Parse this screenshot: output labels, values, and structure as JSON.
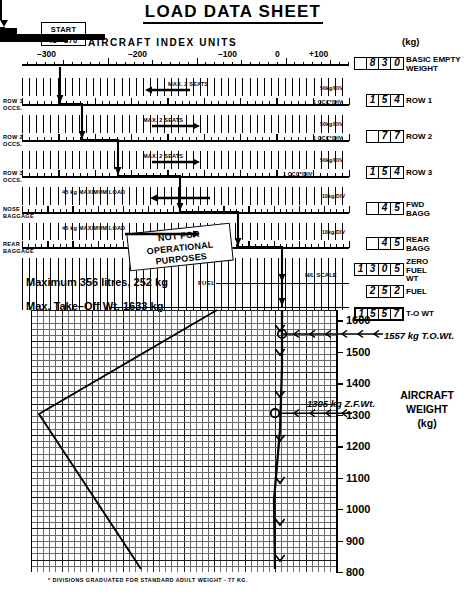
{
  "title": "LOAD DATA SHEET",
  "start": {
    "line1": "START",
    "line2": "IU –270"
  },
  "index_axis": {
    "heading": "AIRCRAFT  INDEX  UNITS",
    "ticks": [
      "–300",
      "–200",
      "–100",
      "0",
      "+100"
    ]
  },
  "units_header": "(kg)",
  "rows": [
    {
      "name": "basic-empty-weight",
      "left_label": "",
      "value": "830",
      "digits": [
        "",
        "8",
        "3",
        "0"
      ],
      "label": "BASIC EMPTY\nWEIGHT",
      "per_div": ""
    },
    {
      "name": "row-1",
      "left_label": "ROW 1\nOCCS.",
      "value": "154",
      "digits": [
        "1",
        "5",
        "4"
      ],
      "label": "ROW 1",
      "per_div": "50kg/DIV",
      "per_div2": "1 OCC*/DIV",
      "seat_note": "MAX. 2 SEATS"
    },
    {
      "name": "row-2",
      "left_label": "ROW 2\nOCCS.",
      "value": "77",
      "digits": [
        "",
        "7",
        "7"
      ],
      "label": "ROW 2",
      "per_div": "50kg/DIV",
      "per_div2": "1 OCC*/DIV",
      "seat_note": "MAX. 2 SEATS"
    },
    {
      "name": "row-3",
      "left_label": "ROW 3\nOCCS.",
      "value": "154",
      "digits": [
        "1",
        "5",
        "4"
      ],
      "label": "ROW 3",
      "per_div": "50kg/DIV",
      "per_div2": "1 OCC*/DIV",
      "seat_note": "MAX. 2 SEATS"
    },
    {
      "name": "fwd-bagg",
      "left_label": "NOSE\nBAGGAGE",
      "value": "45",
      "digits": [
        "",
        "4",
        "5"
      ],
      "label": "FWD\nBAGG",
      "per_div": "10kg/DIV",
      "max_note": "45 kg MAXIMUM LOAD"
    },
    {
      "name": "rear-bagg",
      "left_label": "REAR\nBAGGAGE",
      "value": "45",
      "digits": [
        "",
        "4",
        "5"
      ],
      "label": "REAR\nBAGG",
      "per_div": "10kg/DIV",
      "max_note": "45 kg MAXIMUM LOAD"
    },
    {
      "name": "zero-fuel-wt",
      "left_label": "",
      "value": "1305",
      "digits": [
        "1",
        "3",
        "0",
        "5"
      ],
      "label": "ZERO\nFUEL\nWT",
      "per_div": ""
    },
    {
      "name": "fuel",
      "left_label": "",
      "value": "252",
      "digits": [
        "2",
        "5",
        "2"
      ],
      "label": "FUEL",
      "per_div": "NIL  SCALE"
    },
    {
      "name": "to-wt",
      "left_label": "",
      "value": "1557",
      "digits": [
        "1",
        "5",
        "5",
        "7"
      ],
      "label": "T-O WT",
      "per_div": ""
    }
  ],
  "stamp": "NOT FOR\nOPERATIONAL\nPURPOSES",
  "fuel_note": "Maximum  356 litres, 252 kg",
  "fuel_tag": "FUEL",
  "max_tow_note": "Max. Take–Off Wt. 1633 kg",
  "annotations": {
    "tow": "1557 kg T.O.Wt.",
    "zfw": "1305 kg Z.F.Wt."
  },
  "weight_axis_label": "AIRCRAFT\nWEIGHT\n(kg)",
  "footnote": "* DIVISIONS GRADUATED FOR STANDARD ADULT WEIGHT - 77 KG.",
  "chart_data": {
    "type": "line",
    "title": "LOAD DATA SHEET",
    "xlabel": "AIRCRAFT INDEX UNITS",
    "ylabel": "AIRCRAFT WEIGHT (kg)",
    "ylim": [
      800,
      1633
    ],
    "yticks": [
      1600,
      1500,
      1400,
      1300,
      1200,
      1100,
      1000,
      900,
      800
    ],
    "xlim": [
      -330,
      130
    ],
    "xticks": [
      -300,
      -200,
      -100,
      0,
      100
    ],
    "grid": true,
    "legend": false,
    "series": [
      {
        "name": "cg-envelope-left-boundary",
        "points": [
          [
            -300,
            1633
          ],
          [
            -300,
            1400
          ],
          [
            -300,
            800
          ]
        ]
      },
      {
        "name": "loading-track",
        "points": [
          [
            -270,
            830
          ],
          [
            -270,
            1305
          ],
          [
            -268,
            1557
          ]
        ]
      }
    ],
    "markers": [
      {
        "label": "1557 kg T.O.Wt.",
        "weight": 1557
      },
      {
        "label": "1305 kg Z.F.Wt.",
        "weight": 1305
      }
    ],
    "limits": {
      "max_takeoff_weight_kg": 1633,
      "max_fuel_litres": 356,
      "max_fuel_kg": 252,
      "max_baggage_kg": 45,
      "start_index_units": -270
    }
  }
}
